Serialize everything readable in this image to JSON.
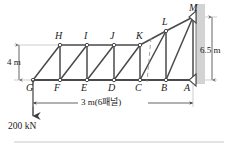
{
  "figure": {
    "type": "truss-diagram",
    "background_color": "#ffffff",
    "line_color": "#3c3c3c",
    "text_color": "#1a1a1a"
  },
  "nodes": {
    "bottom_chord": [
      {
        "id": "G",
        "label": "G",
        "x": 0,
        "y": 0
      },
      {
        "id": "F",
        "label": "F",
        "x": 0.5,
        "y": 0
      },
      {
        "id": "E",
        "label": "E",
        "x": 1.0,
        "y": 0
      },
      {
        "id": "D",
        "label": "D",
        "x": 1.5,
        "y": 0
      },
      {
        "id": "C",
        "label": "C",
        "x": 2.0,
        "y": 0
      },
      {
        "id": "B",
        "label": "B",
        "x": 2.5,
        "y": 0
      },
      {
        "id": "A",
        "label": "A",
        "x": 3.0,
        "y": 0
      }
    ],
    "top_chord": [
      {
        "id": "H",
        "label": "H",
        "x": 0.5,
        "y": 4.0
      },
      {
        "id": "I",
        "label": "I",
        "x": 1.0,
        "y": 4.0
      },
      {
        "id": "J",
        "label": "J",
        "x": 1.5,
        "y": 4.0
      },
      {
        "id": "K",
        "label": "K",
        "x": 2.0,
        "y": 4.0
      },
      {
        "id": "L",
        "label": "L",
        "x": 2.5,
        "y": 5.25
      },
      {
        "id": "M",
        "label": "M",
        "x": 3.0,
        "y": 6.5
      }
    ]
  },
  "dimensions": {
    "left_height": "4 m",
    "right_height": "6.5 m",
    "span": "3 m(6패널)"
  },
  "load": {
    "label": "200 kN",
    "applied_at": "G",
    "direction": "down"
  },
  "supports": {
    "bottom_right": {
      "node": "A",
      "type": "pin-on-wall"
    },
    "top_right": {
      "node": "M",
      "type": "roller-on-wall"
    }
  }
}
